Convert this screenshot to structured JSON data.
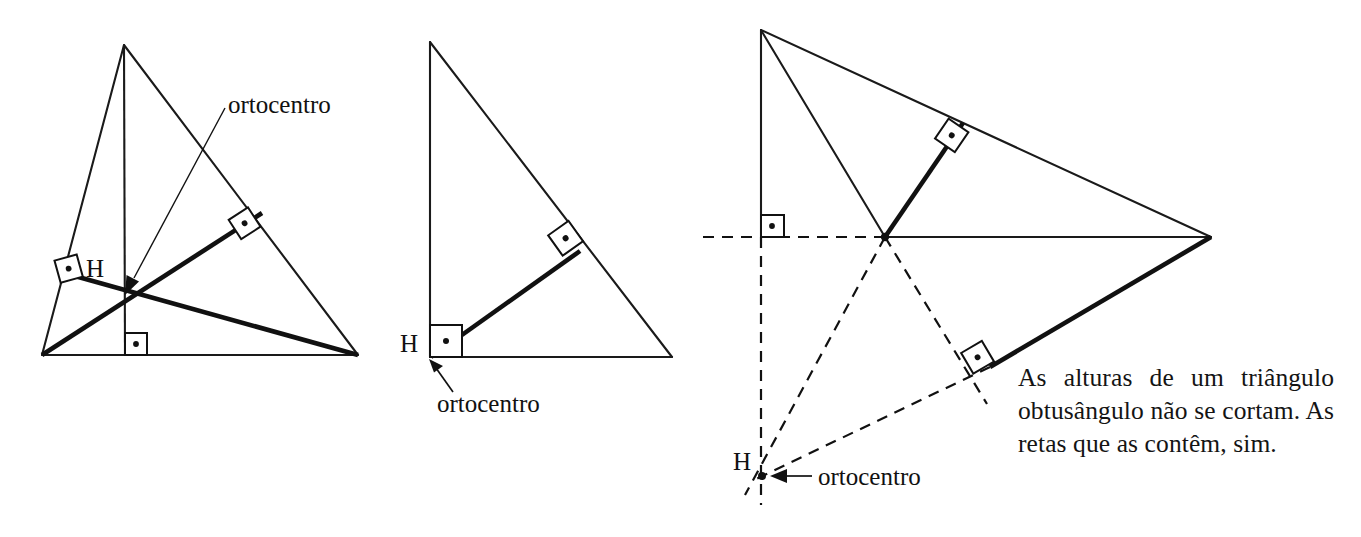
{
  "figure": {
    "caption": "As alturas de um triângulo obtusângulo não se cortam. As retas que as contêm, sim."
  },
  "panels": [
    {
      "id": "acute-triangle",
      "kind": "acute",
      "orthocenter_label": "H",
      "callout_label": "ortocentro",
      "vertices": [
        {
          "name": "apex",
          "x": 124,
          "y": 45
        },
        {
          "name": "bottom-left",
          "x": 42,
          "y": 355
        },
        {
          "name": "bottom-right",
          "x": 358,
          "y": 355
        }
      ],
      "orthocenter": {
        "x": 125,
        "y": 295
      },
      "right_angle_marks": 3
    },
    {
      "id": "right-triangle",
      "kind": "right",
      "orthocenter_label": "H",
      "callout_label": "ortocentro",
      "vertices": [
        {
          "name": "apex",
          "x": 430,
          "y": 42
        },
        {
          "name": "right-angle",
          "x": 430,
          "y": 357
        },
        {
          "name": "bottom-right",
          "x": 672,
          "y": 357
        }
      ],
      "orthocenter": {
        "x": 430,
        "y": 357
      },
      "right_angle_marks": 2
    },
    {
      "id": "obtuse-triangle",
      "kind": "obtuse",
      "orthocenter_label": "H",
      "callout_label": "ortocentro",
      "vertices": [
        {
          "name": "top",
          "x": 761,
          "y": 30
        },
        {
          "name": "middle",
          "x": 885,
          "y": 237
        },
        {
          "name": "right",
          "x": 1211,
          "y": 237
        }
      ],
      "orthocenter": {
        "x": 762,
        "y": 476
      },
      "right_angle_marks": 3
    }
  ],
  "colors": {
    "ink": "#111111",
    "background": "#ffffff"
  }
}
